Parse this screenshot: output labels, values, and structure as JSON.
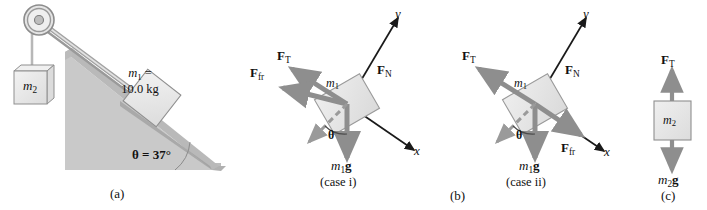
{
  "figure": {
    "background_color": "#ffffff"
  },
  "colors": {
    "incline_fill": "#c9c9c9",
    "incline_top_edge": "#b0b0b0",
    "incline_shadow": "#9a9a9a",
    "block_fill": "#e8e8e8",
    "block_stroke": "#8a8a8a",
    "arrow_gray": "#8e8e8e",
    "axis_black": "#1a1a1a",
    "rope_gray": "#a8a8a8",
    "text": "#111111"
  },
  "panel_a": {
    "caption": "(a)",
    "mass1_line1": "m",
    "mass1_sub": "1",
    "mass1_eq": " =",
    "mass1_line2": "10.0 kg",
    "mass2": "m",
    "mass2_sub": "2",
    "angle_label": "θ = 37°",
    "angle_symbol": "θ",
    "angle_value": "37°"
  },
  "panel_b": {
    "caption": "(b)",
    "case_i": {
      "caption": "(case i)",
      "axis_y": "y",
      "axis_x": "x",
      "mass_label": "m",
      "mass_sub": "1",
      "theta": "θ",
      "forces": [
        {
          "name": "F_T",
          "symbol": "F",
          "sub": "T",
          "label": "FT"
        },
        {
          "name": "F_fr",
          "symbol": "F",
          "sub": "fr",
          "label": "Ffr"
        },
        {
          "name": "F_N",
          "symbol": "F",
          "sub": "N",
          "label": "FN"
        }
      ],
      "weight_symbol": "m",
      "weight_sub": "1",
      "weight_g": "g"
    },
    "case_ii": {
      "caption": "(case ii)",
      "axis_y": "y",
      "axis_x": "x",
      "mass_label": "m",
      "mass_sub": "1",
      "theta": "θ",
      "forces": [
        {
          "name": "F_T",
          "symbol": "F",
          "sub": "T",
          "label": "FT"
        },
        {
          "name": "F_N",
          "symbol": "F",
          "sub": "N",
          "label": "FN"
        },
        {
          "name": "F_fr",
          "symbol": "F",
          "sub": "fr",
          "label": "Ffr"
        }
      ],
      "weight_symbol": "m",
      "weight_sub": "1",
      "weight_g": "g"
    }
  },
  "panel_c": {
    "caption": "(c)",
    "tension_symbol": "F",
    "tension_sub": "T",
    "mass_label": "m",
    "mass_sub": "2",
    "weight_symbol": "m",
    "weight_sub": "2",
    "weight_g": "g"
  }
}
